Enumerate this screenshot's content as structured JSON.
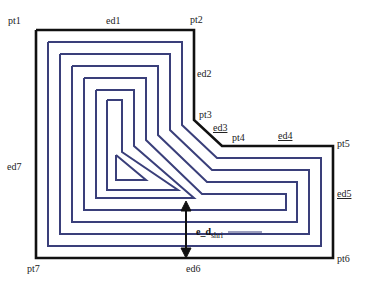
{
  "diagram": {
    "colors": {
      "boundary": "#111111",
      "contour": "#3a3f7a",
      "background": "#ffffff"
    },
    "points": [
      {
        "id": "pt1",
        "label": "pt1"
      },
      {
        "id": "pt2",
        "label": "pt2"
      },
      {
        "id": "pt3",
        "label": "pt3"
      },
      {
        "id": "pt4",
        "label": "pt4"
      },
      {
        "id": "pt5",
        "label": "pt5"
      },
      {
        "id": "pt6",
        "label": "pt6"
      },
      {
        "id": "pt7",
        "label": "pt7"
      }
    ],
    "edges": [
      {
        "id": "ed1",
        "label": "ed1",
        "underlined": false
      },
      {
        "id": "ed2",
        "label": "ed2",
        "underlined": false
      },
      {
        "id": "ed3",
        "label": "ed3",
        "underlined": true
      },
      {
        "id": "ed4",
        "label": "ed4",
        "underlined": true
      },
      {
        "id": "ed5",
        "label": "ed5",
        "underlined": true
      },
      {
        "id": "ed6",
        "label": "ed6",
        "underlined": false
      },
      {
        "id": "ed7",
        "label": "ed7",
        "underlined": false
      }
    ],
    "dimension": {
      "main": "e_d",
      "subscript": "shri"
    },
    "contour_count": 6
  }
}
